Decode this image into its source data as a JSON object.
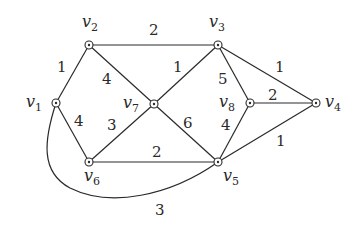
{
  "diagram": {
    "type": "weighted-undirected-graph",
    "nodes": [
      {
        "id": "v1",
        "label": "v",
        "sub": "1",
        "x": 56,
        "y": 103
      },
      {
        "id": "v2",
        "label": "v",
        "sub": "2",
        "x": 89,
        "y": 45
      },
      {
        "id": "v3",
        "label": "v",
        "sub": "3",
        "x": 218,
        "y": 45
      },
      {
        "id": "v4",
        "label": "v",
        "sub": "4",
        "x": 316,
        "y": 103
      },
      {
        "id": "v5",
        "label": "v",
        "sub": "5",
        "x": 218,
        "y": 162
      },
      {
        "id": "v6",
        "label": "v",
        "sub": "6",
        "x": 89,
        "y": 162
      },
      {
        "id": "v7",
        "label": "v",
        "sub": "7",
        "x": 154,
        "y": 104
      },
      {
        "id": "v8",
        "label": "v",
        "sub": "8",
        "x": 250,
        "y": 103
      }
    ],
    "edges": [
      {
        "from": "v1",
        "to": "v2",
        "weight": "1"
      },
      {
        "from": "v2",
        "to": "v3",
        "weight": "2"
      },
      {
        "from": "v2",
        "to": "v7",
        "weight": "4"
      },
      {
        "from": "v7",
        "to": "v3",
        "weight": "1"
      },
      {
        "from": "v3",
        "to": "v8",
        "weight": "5"
      },
      {
        "from": "v3",
        "to": "v4",
        "weight": "1"
      },
      {
        "from": "v8",
        "to": "v4",
        "weight": "2"
      },
      {
        "from": "v1",
        "to": "v6",
        "weight": "4"
      },
      {
        "from": "v6",
        "to": "v7",
        "weight": "3"
      },
      {
        "from": "v7",
        "to": "v5",
        "weight": "6"
      },
      {
        "from": "v6",
        "to": "v5",
        "weight": "2"
      },
      {
        "from": "v8",
        "to": "v5",
        "weight": "4"
      },
      {
        "from": "v5",
        "to": "v4",
        "weight": "1"
      },
      {
        "from": "v1",
        "to": "v5",
        "weight": "3",
        "curved": true
      }
    ]
  }
}
